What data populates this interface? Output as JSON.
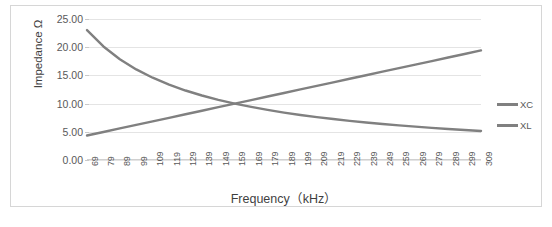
{
  "chart_data": {
    "type": "line",
    "title": "",
    "xlabel": "Frequency（kHz）",
    "ylabel": "Impedance Ω",
    "xlim": [
      69,
      309
    ],
    "ylim": [
      0,
      25
    ],
    "ytick_step": 5,
    "grid": true,
    "legend_position": "right",
    "x": [
      69,
      79,
      89,
      99,
      109,
      119,
      129,
      139,
      149,
      159,
      169,
      179,
      189,
      199,
      209,
      219,
      229,
      239,
      249,
      259,
      269,
      279,
      289,
      299,
      309
    ],
    "xticklabels": [
      "69",
      "79",
      "89",
      "99",
      "109",
      "119",
      "129",
      "139",
      "149",
      "159",
      "169",
      "179",
      "189",
      "199",
      "209",
      "219",
      "229",
      "239",
      "249",
      "259",
      "269",
      "279",
      "289",
      "299",
      "309"
    ],
    "yticklabels": [
      "0.00",
      "5.00",
      "10.00",
      "15.00",
      "20.00",
      "25.00"
    ],
    "ytickvalues": [
      0,
      5,
      10,
      15,
      20,
      25
    ],
    "series": [
      {
        "name": "XC",
        "color": "#808080",
        "values": [
          23.04,
          20.13,
          17.87,
          16.06,
          14.59,
          13.36,
          12.32,
          11.44,
          10.67,
          10.0,
          9.41,
          8.88,
          8.41,
          7.99,
          7.61,
          7.26,
          6.94,
          6.65,
          6.38,
          6.14,
          5.91,
          5.7,
          5.5,
          5.31,
          5.14
        ]
      },
      {
        "name": "XL",
        "color": "#808080",
        "values": [
          4.34,
          4.97,
          5.6,
          6.22,
          6.85,
          7.48,
          8.11,
          8.74,
          9.37,
          10.0,
          10.63,
          11.26,
          11.88,
          12.51,
          13.14,
          13.77,
          14.4,
          15.03,
          15.66,
          16.29,
          16.91,
          17.54,
          18.17,
          18.8,
          19.43
        ]
      }
    ],
    "legend": [
      {
        "label": "XC",
        "color": "#808080"
      },
      {
        "label": "XL",
        "color": "#808080"
      }
    ]
  },
  "style": {
    "grid_color": "#e4e4e4",
    "border_color": "#d6d6d6",
    "tick_text_color": "#595959",
    "axis_title_color": "#3f3f3f",
    "plot_background": "#ffffff"
  }
}
